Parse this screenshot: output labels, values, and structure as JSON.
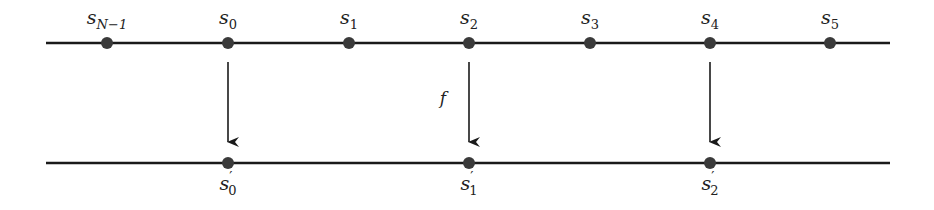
{
  "diagram": {
    "line_color": "#1a1a1a",
    "node_color": "#3a3a3a",
    "top_row": {
      "nodes": [
        {
          "base": "s",
          "sub": "N−1",
          "prime": ""
        },
        {
          "base": "s",
          "sub": "0",
          "prime": ""
        },
        {
          "base": "s",
          "sub": "1",
          "prime": ""
        },
        {
          "base": "s",
          "sub": "2",
          "prime": ""
        },
        {
          "base": "s",
          "sub": "3",
          "prime": ""
        },
        {
          "base": "s",
          "sub": "4",
          "prime": ""
        },
        {
          "base": "s",
          "sub": "5",
          "prime": ""
        }
      ]
    },
    "bottom_row": {
      "nodes": [
        {
          "base": "s",
          "sub": "0",
          "prime": "′",
          "maps_from": "s_0"
        },
        {
          "base": "s",
          "sub": "1",
          "prime": "′",
          "maps_from": "s_2"
        },
        {
          "base": "s",
          "sub": "2",
          "prime": "′",
          "maps_from": "s_4"
        }
      ]
    },
    "arrow_label": "f"
  }
}
